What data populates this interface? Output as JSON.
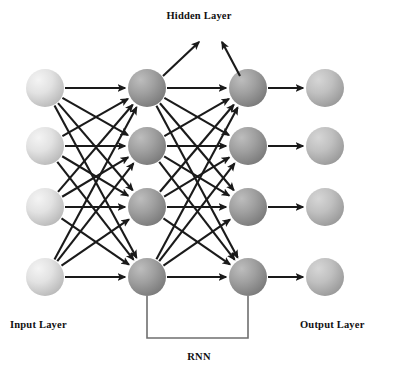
{
  "figure": {
    "title_hidden": "Hidden Layer",
    "label_input": "Input Layer",
    "label_output": "Output Layer",
    "label_rnn": "RNN"
  },
  "colors": {
    "input_node_light": "#eeeeee",
    "input_node_dark": "#b9b9b9",
    "hidden_node_light": "#b2b2b2",
    "hidden_node_dark": "#7c7c7c",
    "output_node_light": "#c8c8c8",
    "output_node_dark": "#9a9a9a",
    "edge": "#1a1a1a",
    "rnn_loop": "#6f6f6f",
    "background": "#ffffff",
    "text": "#111111"
  },
  "geometry": {
    "width": 398,
    "height": 380,
    "node_radius": 19,
    "rows_y": [
      88,
      146,
      207,
      277
    ],
    "columns_x": [
      45,
      147,
      248,
      325
    ]
  },
  "layers": [
    {
      "id": "input",
      "name": "Input Layer",
      "column_x": 45,
      "node_count": 4,
      "style": "input",
      "nodes": [
        {
          "id": "i1",
          "cx": 45,
          "cy": 88
        },
        {
          "id": "i2",
          "cx": 45,
          "cy": 146
        },
        {
          "id": "i3",
          "cx": 45,
          "cy": 207
        },
        {
          "id": "i4",
          "cx": 45,
          "cy": 277
        }
      ]
    },
    {
      "id": "hidden1",
      "name": "Hidden Layer 1",
      "column_x": 147,
      "node_count": 4,
      "style": "hidden",
      "nodes": [
        {
          "id": "h1a",
          "cx": 147,
          "cy": 88
        },
        {
          "id": "h1b",
          "cx": 147,
          "cy": 146
        },
        {
          "id": "h1c",
          "cx": 147,
          "cy": 207
        },
        {
          "id": "h1d",
          "cx": 147,
          "cy": 277
        }
      ]
    },
    {
      "id": "hidden2",
      "name": "Hidden Layer 2",
      "column_x": 248,
      "node_count": 4,
      "style": "hidden",
      "nodes": [
        {
          "id": "h2a",
          "cx": 248,
          "cy": 88
        },
        {
          "id": "h2b",
          "cx": 248,
          "cy": 146
        },
        {
          "id": "h2c",
          "cx": 248,
          "cy": 207
        },
        {
          "id": "h2d",
          "cx": 248,
          "cy": 277
        }
      ]
    },
    {
      "id": "output",
      "name": "Output Layer",
      "column_x": 325,
      "node_count": 4,
      "style": "output",
      "nodes": [
        {
          "id": "o1",
          "cx": 325,
          "cy": 88
        },
        {
          "id": "o2",
          "cx": 325,
          "cy": 146
        },
        {
          "id": "o3",
          "cx": 325,
          "cy": 207
        },
        {
          "id": "o4",
          "cx": 325,
          "cy": 277
        }
      ]
    }
  ],
  "connections": [
    {
      "from_layer": "input",
      "to_layer": "hidden1",
      "pattern": "fully-connected",
      "directed": true
    },
    {
      "from_layer": "hidden1",
      "to_layer": "hidden2",
      "pattern": "fully-connected",
      "directed": true
    },
    {
      "from_layer": "hidden2",
      "to_layer": "output",
      "pattern": "one-to-one",
      "directed": true
    }
  ],
  "callout_arrows": [
    {
      "id": "hidden-callout-left",
      "from": {
        "x": 163,
        "y": 76
      },
      "to": {
        "x": 199,
        "y": 42
      },
      "points_to": "Hidden Layer"
    },
    {
      "id": "hidden-callout-right",
      "from": {
        "x": 240,
        "y": 76
      },
      "to": {
        "x": 222,
        "y": 42
      },
      "points_to": "Hidden Layer"
    }
  ],
  "rnn_loop": {
    "label": "RNN",
    "from_node": "h1d",
    "to_node": "h2d",
    "path": [
      {
        "x": 147,
        "y": 296
      },
      {
        "x": 147,
        "y": 338
      },
      {
        "x": 248,
        "y": 338
      },
      {
        "x": 248,
        "y": 296
      }
    ]
  }
}
